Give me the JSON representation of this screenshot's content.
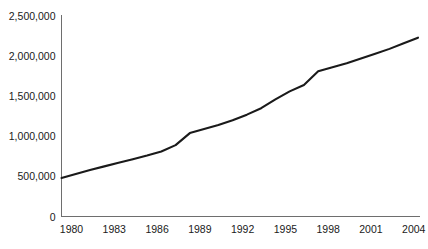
{
  "chart_data": {
    "type": "line",
    "title": "",
    "subtitle": "",
    "xlabel": "",
    "ylabel": "",
    "grid": false,
    "legend": "none",
    "xlim": [
      1980,
      2005
    ],
    "ylim": [
      0,
      2500000
    ],
    "x_tick_labels": [
      "1980",
      "1983",
      "1986",
      "1989",
      "1992",
      "1995",
      "1998",
      "2001",
      "2004"
    ],
    "x_ticks": [
      1980,
      1983,
      1986,
      1989,
      1992,
      1995,
      1998,
      2001,
      2004
    ],
    "y_tick_labels": [
      "0",
      "500,000",
      "1,000,000",
      "1,500,000",
      "2,000,000",
      "2,500,000"
    ],
    "y_ticks": [
      0,
      500000,
      1000000,
      1500000,
      2000000,
      2500000
    ],
    "line_color": "#1a1a1a",
    "axis_color": "#6e6e6e",
    "line_width": 2.1,
    "series": [
      {
        "name": "value",
        "x": [
          1980,
          1981,
          1982,
          1983,
          1984,
          1985,
          1986,
          1987,
          1988,
          1989,
          1990,
          1991,
          1992,
          1993,
          1994,
          1995,
          1996,
          1997,
          1998,
          1999,
          2000,
          2001,
          2002,
          2003,
          2004,
          2005
        ],
        "values": [
          480000,
          530000,
          580000,
          625000,
          670000,
          715000,
          760000,
          810000,
          890000,
          1040000,
          1090000,
          1140000,
          1200000,
          1270000,
          1350000,
          1460000,
          1560000,
          1640000,
          1810000,
          1860000,
          1910000,
          1970000,
          2030000,
          2090000,
          2160000,
          2230000
        ]
      }
    ]
  }
}
